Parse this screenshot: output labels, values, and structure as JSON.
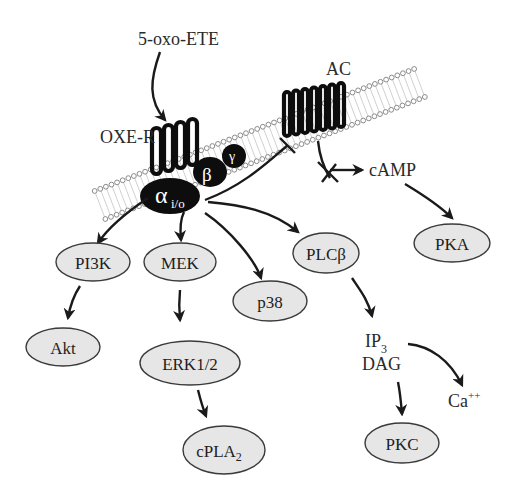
{
  "diagram": {
    "ligand": "5-oxo-ETE",
    "receptor": "OXE-R",
    "effector": "AC",
    "g_protein": {
      "alpha": "α",
      "alpha_sub": "i/o",
      "beta": "β",
      "gamma": "γ"
    },
    "second_messenger_camp": "cAMP",
    "nodes": {
      "pi3k": "PI3K",
      "mek": "MEK",
      "p38": "p38",
      "plcb": "PLCβ",
      "pka": "PKA",
      "akt": "Akt",
      "erk": "ERK1/2",
      "cpla2": "cPLA",
      "cpla2_sub": "2",
      "pkc": "PKC"
    },
    "messengers": {
      "ip3": "IP",
      "ip3_sub": "3",
      "dag": "DAG",
      "ca": "Ca",
      "ca_sup": "++"
    },
    "colors": {
      "node_fill": "#e6e6e6",
      "node_stroke": "#3a3a3a",
      "gprotein": "#0d0d0d",
      "arrow": "#1a1a1a"
    }
  }
}
